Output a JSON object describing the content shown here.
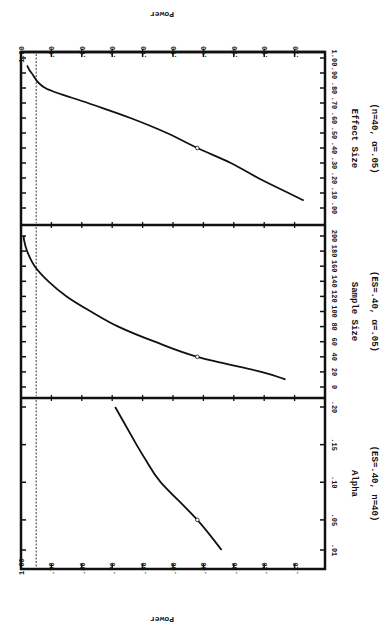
{
  "chart_data": {
    "type": "line",
    "orientation": "rotated 90° clockwise (power axis horizontal, decreasing left-to-right)",
    "shared_axis": {
      "label": "Power",
      "ticks": [
        "1.00",
        ".90",
        ".80",
        ".70",
        ".60",
        ".50",
        ".40",
        ".30",
        ".20",
        ".10"
      ],
      "range": [
        0,
        1.0
      ]
    },
    "reference_line": {
      "style": "dashed",
      "power": 0.95
    },
    "panels": [
      {
        "id": "effect-size",
        "title": "Effect Size",
        "subtitle": "(n=40, α=.05)",
        "xlabel": "Effect Size",
        "x_ticks": [
          ".00",
          ".10",
          ".20",
          ".30",
          ".40",
          ".50",
          ".60",
          ".70",
          ".80",
          ".90",
          "1.00"
        ],
        "x_range": [
          0,
          1.0
        ],
        "x": [
          0.05,
          0.1,
          0.2,
          0.3,
          0.4,
          0.5,
          0.6,
          0.7,
          0.8,
          0.9,
          0.95
        ],
        "power": [
          0.07,
          0.12,
          0.22,
          0.31,
          0.42,
          0.52,
          0.64,
          0.78,
          0.92,
          0.965,
          0.98
        ],
        "marker": {
          "x": 0.4,
          "power": 0.42
        }
      },
      {
        "id": "sample-size",
        "title": "Sample Size",
        "subtitle": "(ES=.40, α=.05)",
        "xlabel": "Sample Size",
        "x_ticks": [
          "0",
          "20",
          "40",
          "60",
          "80",
          "100",
          "120",
          "140",
          "160",
          "180",
          "200"
        ],
        "x_range": [
          -20,
          220
        ],
        "x": [
          10,
          20,
          40,
          60,
          80,
          100,
          120,
          140,
          160,
          180,
          195,
          200
        ],
        "power": [
          0.13,
          0.21,
          0.42,
          0.56,
          0.68,
          0.77,
          0.85,
          0.91,
          0.955,
          0.98,
          0.99,
          0.99
        ],
        "marker": {
          "x": 40,
          "power": 0.42
        }
      },
      {
        "id": "alpha",
        "title": "Alpha",
        "subtitle": "(ES=.40, n=40)",
        "xlabel": "Alpha",
        "x_ticks": [
          ".01",
          ".05",
          ".10",
          ".15",
          ".20"
        ],
        "x_range": [
          -0.015,
          0.225
        ],
        "x": [
          0.01,
          0.05,
          0.1,
          0.13,
          0.15,
          0.2
        ],
        "power": [
          0.34,
          0.42,
          0.54,
          0.59,
          0.62,
          0.69
        ],
        "marker": {
          "x": 0.05,
          "power": 0.42
        }
      }
    ]
  }
}
